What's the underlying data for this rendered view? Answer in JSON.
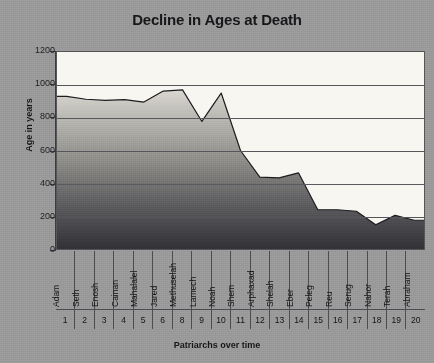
{
  "chart_data": {
    "type": "area",
    "title": "Decline in Ages at Death",
    "xlabel": "Patriarchs over time",
    "ylabel": "Age in years",
    "ylim": [
      0,
      1200
    ],
    "yticks": [
      0,
      200,
      400,
      600,
      800,
      1000,
      1200
    ],
    "grid": true,
    "legend": "none",
    "categories": [
      "Adam",
      "Seth",
      "Enosh",
      "Cainan",
      "Mahalalel",
      "Jared",
      "Methuselah",
      "Lamech",
      "Noah",
      "Shem",
      "Arphaxad",
      "Shelah",
      "Eber",
      "Peleg",
      "Reu",
      "Serug",
      "Nahor",
      "Terah",
      "Abraham"
    ],
    "category_numbers": [
      "1",
      "2",
      "3",
      "4",
      "5",
      "6",
      "8",
      "9",
      "10",
      "11",
      "12",
      "13",
      "14",
      "15",
      "16",
      "17",
      "18",
      "19",
      "20"
    ],
    "values": [
      930,
      912,
      905,
      910,
      895,
      962,
      969,
      777,
      950,
      600,
      438,
      433,
      464,
      239,
      239,
      230,
      148,
      205,
      175
    ],
    "series_name": "Age at death"
  },
  "colors": {
    "background": "#9a9a9a",
    "plot_background": "#f7f6f1",
    "axis": "#3b3b40",
    "grid": "#57575d",
    "area_top": "#d9d7d0",
    "area_bottom": "#3a3a3e",
    "text": "#17171a"
  }
}
